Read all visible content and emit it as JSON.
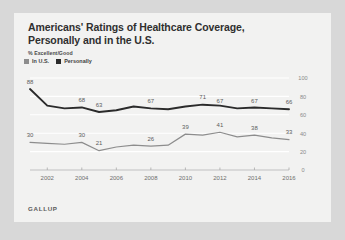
{
  "chart_data": {
    "type": "line",
    "title": "Americans' Ratings of Healthcare Coverage, Personally and in the U.S.",
    "subtitle": "% Excellent/Good",
    "source": "GALLUP",
    "xlabel": "",
    "ylabel": "",
    "ylim": [
      0,
      100
    ],
    "yticks": [
      "0",
      "20",
      "40",
      "60",
      "80",
      "100"
    ],
    "xticks": [
      "2002",
      "2004",
      "2006",
      "2008",
      "2010",
      "2012",
      "2014",
      "2016"
    ],
    "grid": true,
    "legend_position": "top-left",
    "x": [
      2001,
      2002,
      2003,
      2004,
      2005,
      2006,
      2007,
      2008,
      2009,
      2010,
      2011,
      2012,
      2013,
      2014,
      2015,
      2016
    ],
    "series": [
      {
        "name": "Personally",
        "color": "#2b2b2b",
        "values": [
          88,
          70,
          67,
          68,
          63,
          65,
          69,
          67,
          66,
          69,
          71,
          70,
          67,
          68,
          67,
          66
        ],
        "labels": [
          {
            "x": 2001,
            "value": 88
          },
          {
            "x": 2004,
            "value": 68
          },
          {
            "x": 2005,
            "value": 63
          },
          {
            "x": 2008,
            "value": 67
          },
          {
            "x": 2011,
            "value": 71
          },
          {
            "x": 2012,
            "value": 67
          },
          {
            "x": 2014,
            "value": 67
          },
          {
            "x": 2016,
            "value": 66
          }
        ]
      },
      {
        "name": "In U.S.",
        "color": "#8d8d8d",
        "values": [
          30,
          29,
          28,
          30,
          21,
          25,
          27,
          26,
          27,
          39,
          38,
          41,
          36,
          38,
          35,
          33
        ],
        "labels": [
          {
            "x": 2001,
            "value": 30
          },
          {
            "x": 2004,
            "value": 30
          },
          {
            "x": 2005,
            "value": 21
          },
          {
            "x": 2008,
            "value": 26
          },
          {
            "x": 2010,
            "value": 39
          },
          {
            "x": 2012,
            "value": 41
          },
          {
            "x": 2014,
            "value": 38
          },
          {
            "x": 2016,
            "value": 33
          }
        ]
      }
    ]
  }
}
